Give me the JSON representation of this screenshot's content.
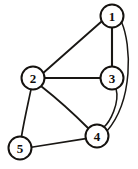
{
  "figure": {
    "kind": "undirected-graph-diagram",
    "background_color": "#ffffff",
    "ink_color": "#191714",
    "node_fill_color": "#ffffff",
    "width": 138,
    "height": 169
  },
  "nodes": [
    {
      "id": "1",
      "label": "1",
      "cx": 112,
      "cy": 16,
      "r": 11.5
    },
    {
      "id": "2",
      "label": "2",
      "cx": 33,
      "cy": 78,
      "r": 11.5
    },
    {
      "id": "3",
      "label": "3",
      "cx": 112,
      "cy": 78,
      "r": 11.5
    },
    {
      "id": "4",
      "label": "4",
      "cx": 97,
      "cy": 136,
      "r": 11.5
    },
    {
      "id": "5",
      "label": "5",
      "cx": 20,
      "cy": 148,
      "r": 11.5
    }
  ],
  "edges": [
    {
      "id": "e-1-2",
      "from": "1",
      "to": "2",
      "shape": "line",
      "path": "M 101.8 21.2 L 43.2 73.0",
      "width": 1.9
    },
    {
      "id": "e-1-3",
      "from": "1",
      "to": "3",
      "shape": "line",
      "path": "M 112 27.5 L 112 66.5",
      "width": 2.1
    },
    {
      "id": "e-1-4",
      "from": "1",
      "to": "4",
      "shape": "curve",
      "path": "M 121.5 22.0 C 131.5 45.0 133.5 100.0 107.0 131.0",
      "width": 1.5
    },
    {
      "id": "e-2-3",
      "from": "2",
      "to": "3",
      "shape": "line",
      "path": "M 44.5 78 L 100.5 78",
      "width": 2.1
    },
    {
      "id": "e-2-4",
      "from": "2",
      "to": "4",
      "shape": "curve",
      "path": "M 41.5 86.5 C 60.0 101.0 76.0 116.0 88.5 128.5",
      "width": 1.9
    },
    {
      "id": "e-2-5",
      "from": "2",
      "to": "5",
      "shape": "curve",
      "path": "M 31.0 89.4 C 27.5 106.0 24.0 121.0 21.5 136.5",
      "width": 1.7
    },
    {
      "id": "e-3-4",
      "from": "3",
      "to": "4",
      "shape": "curve",
      "path": "M 116.0 88.5 C 120.0 103.0 110.0 122.0 103.5 127.5",
      "width": 1.5
    },
    {
      "id": "e-4-5",
      "from": "4",
      "to": "5",
      "shape": "line",
      "path": "M 85.8 138.6 L 31.3 147.2",
      "width": 1.6
    }
  ]
}
